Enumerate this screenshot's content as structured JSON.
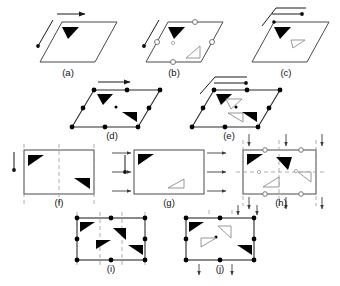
{
  "figure": {
    "background_color": "#ffffff",
    "stroke_color": "#4a4a4a",
    "fill_color": "#000000",
    "open_symbol_color": "#ffffff",
    "dash_color": "#9a9a9a",
    "width": 340,
    "height": 286
  },
  "captions": {
    "a": "(a)",
    "b": "(b)",
    "c": "(c)",
    "d": "(d)",
    "e": "(e)",
    "f": "(f)",
    "g": "(g)",
    "h": "(h)",
    "i": "(i)",
    "j": "(j)"
  },
  "panels": [
    {
      "id": "a",
      "label": "(a)",
      "shape": "parallelogram",
      "filled_triangles": 1,
      "open_triangles": 0,
      "lattice_dots": 0,
      "open_circles": 0,
      "arrows": [
        "horizontal-right-top",
        "diagonal-down-left"
      ],
      "dashed_lines": 0
    },
    {
      "id": "b",
      "label": "(b)",
      "shape": "parallelogram",
      "filled_triangles": 1,
      "open_triangles": 1,
      "lattice_dots": 1,
      "open_circles": 4,
      "arrows": [
        "diagonal-down-left"
      ],
      "dashed_lines": 0
    },
    {
      "id": "c",
      "label": "(c)",
      "shape": "parallelogram",
      "filled_triangles": 1,
      "open_triangles": 1,
      "lattice_dots": 1,
      "open_circles": 0,
      "arrows": [
        "hooked-horizontal-right-top"
      ],
      "dashed_lines": 0
    },
    {
      "id": "d",
      "label": "(d)",
      "shape": "parallelogram",
      "filled_triangles": 2,
      "open_triangles": 0,
      "lattice_dots": 9,
      "open_circles": 0,
      "arrows": [
        "horizontal-right-top"
      ],
      "dashed_lines": 0
    },
    {
      "id": "e",
      "label": "(e)",
      "shape": "parallelogram",
      "filled_triangles": 2,
      "open_triangles": 2,
      "lattice_dots": 9,
      "open_circles": 0,
      "arrows": [
        "hooked-horizontal-right-top"
      ],
      "dashed_lines": 0
    },
    {
      "id": "f",
      "label": "(f)",
      "shape": "rectangle",
      "filled_triangles": 2,
      "open_triangles": 0,
      "lattice_dots": 0,
      "open_circles": 0,
      "arrows": [
        "vertical-down-left"
      ],
      "dashed_lines": 5
    },
    {
      "id": "g",
      "label": "(g)",
      "shape": "rectangle",
      "filled_triangles": 1,
      "open_triangles": 1,
      "lattice_dots": 0,
      "open_circles": 0,
      "arrows": [
        "left-in-top",
        "left-in-mid",
        "left-in-bottom",
        "right-out-top",
        "right-out-mid",
        "right-out-bottom",
        "vertical-down-inner"
      ],
      "dashed_lines": 0
    },
    {
      "id": "h",
      "label": "(h)",
      "shape": "rectangle",
      "filled_triangles": 2,
      "open_triangles": 2,
      "lattice_dots": 2,
      "open_circles": 4,
      "arrows": [
        "down-top-left",
        "down-top-mid",
        "down-top-right",
        "down-bottom-left",
        "down-bottom-mid",
        "down-bottom-right"
      ],
      "dashed_lines": 4
    },
    {
      "id": "i",
      "label": "(i)",
      "shape": "rectangle",
      "filled_triangles": 4,
      "open_triangles": 0,
      "lattice_dots": 10,
      "open_circles": 0,
      "arrows": [],
      "dashed_lines": 4
    },
    {
      "id": "j",
      "label": "(j)",
      "shape": "rectangle",
      "filled_triangles": 2,
      "open_triangles": 2,
      "lattice_dots": 9,
      "open_circles": 0,
      "arrows": [
        "down-below-left",
        "down-below-mid",
        "down-top-left",
        "down-top-mid"
      ],
      "dashed_lines": 2
    }
  ]
}
